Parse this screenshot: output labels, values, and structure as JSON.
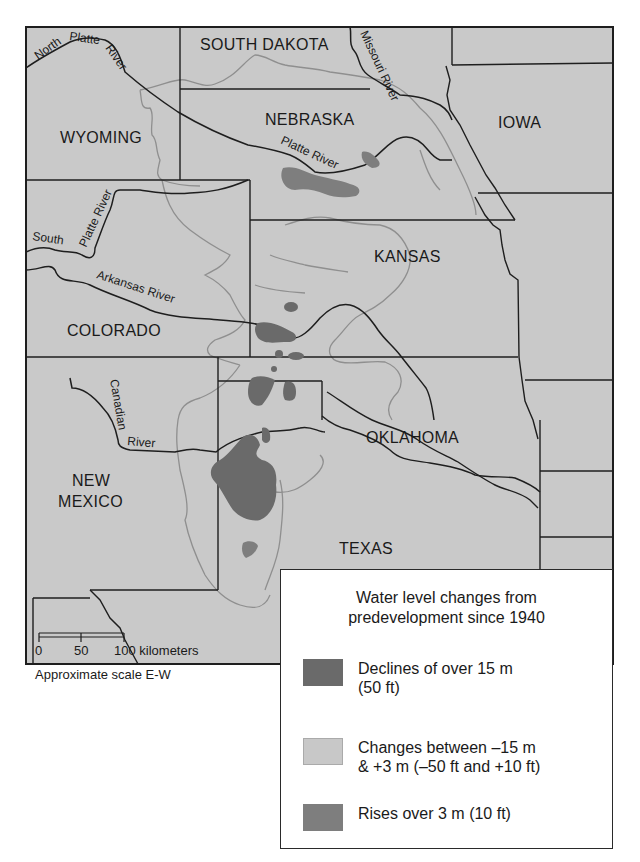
{
  "map": {
    "states": [
      {
        "name": "SOUTH DAKOTA",
        "x": 200,
        "y": 50
      },
      {
        "name": "NEBRASKA",
        "x": 265,
        "y": 125
      },
      {
        "name": "IOWA",
        "x": 498,
        "y": 128
      },
      {
        "name": "WYOMING",
        "x": 60,
        "y": 143
      },
      {
        "name": "KANSAS",
        "x": 374,
        "y": 262
      },
      {
        "name": "COLORADO",
        "x": 67,
        "y": 336
      },
      {
        "name": "OKLAHOMA",
        "x": 366,
        "y": 443
      },
      {
        "name": "NEW",
        "x": 72,
        "y": 486
      },
      {
        "name": "MEXICO",
        "x": 58,
        "y": 507
      },
      {
        "name": "TEXAS",
        "x": 339,
        "y": 554
      }
    ],
    "rivers": [
      "North Platte River",
      "Missouri River",
      "Platte River",
      "South Platte River",
      "Arkansas River",
      "Canadian River"
    ],
    "river_labels": {
      "north_platte_1": "North",
      "north_platte_2": "Platte",
      "north_platte_3": "River",
      "missouri": "Missouri River",
      "platte": "Platte River",
      "south_platte_1": "South",
      "south_platte_2": "Platte River",
      "arkansas": "Arkansas River",
      "canadian_1": "Canadian",
      "canadian_2": "River"
    },
    "scale": {
      "ticks": [
        "0",
        "50",
        "100 kilometers"
      ],
      "caption": "Approximate scale E-W"
    },
    "colors": {
      "land": "#c9c9c9",
      "border": "#1e1e1e",
      "aquifer_outline": "#8f8f8f",
      "decline": "#6a6a6a",
      "rise": "#7e7e7e",
      "change": "#c4c4c4"
    }
  },
  "legend": {
    "title_line1": "Water level changes from",
    "title_line2": "predevelopment since 1940",
    "items": [
      {
        "label_line1": "Declines of over 15 m",
        "label_line2": "(50 ft)",
        "color": "#6a6a6a"
      },
      {
        "label_line1": "Changes between –15 m",
        "label_line2": "& +3 m (–50 ft and +10 ft)",
        "color": "#c8c8c8"
      },
      {
        "label_line1": "Rises over 3 m (10 ft)",
        "label_line2": "",
        "color": "#7e7e7e"
      }
    ]
  }
}
